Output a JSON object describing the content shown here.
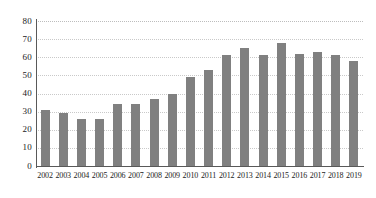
{
  "chart_data": {
    "type": "bar",
    "title": "",
    "subtitle": "",
    "xlabel": "",
    "ylabel": "",
    "categories": [
      "2002",
      "2003",
      "2004",
      "2005",
      "2006",
      "2007",
      "2008",
      "2009",
      "2010",
      "2011",
      "2012",
      "2013",
      "2014",
      "2015",
      "2016",
      "2017",
      "2018",
      "2019"
    ],
    "values": [
      31,
      29,
      26,
      26,
      34,
      34,
      37,
      40,
      49,
      53,
      61,
      65,
      61.5,
      68,
      62,
      63,
      61,
      58
    ],
    "series": [
      {
        "name": "",
        "values": [
          31,
          29,
          26,
          26,
          34,
          34,
          37,
          40,
          49,
          53,
          61,
          65,
          61.5,
          68,
          62,
          63,
          61,
          58
        ]
      }
    ],
    "ylim": [
      0,
      80
    ],
    "ytick_labels": [
      "0",
      "10",
      "20",
      "30",
      "40",
      "50",
      "60",
      "70",
      "80"
    ],
    "ytick_values": [
      0,
      10,
      20,
      30,
      40,
      50,
      60,
      70,
      80
    ],
    "grid": true,
    "grid_axis": "y",
    "legend": false,
    "legend_position": "none",
    "annotations": [],
    "colors": {
      "bar": "#808080",
      "gridline": "#c9c9c9",
      "axis": "#595959",
      "text": "#1a1a1a",
      "background": "#ffffff"
    }
  }
}
